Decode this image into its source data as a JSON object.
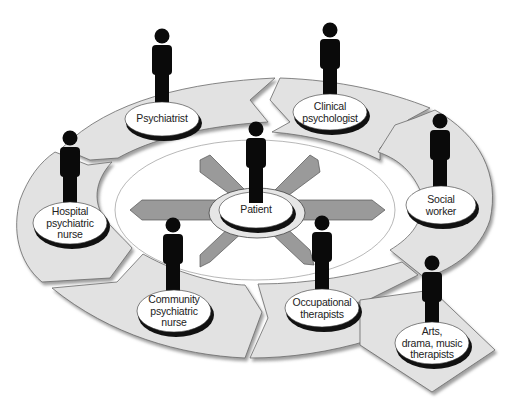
{
  "diagram": {
    "center": {
      "label": "Patient"
    },
    "roles": [
      {
        "id": "psychiatrist",
        "lines": [
          "Psychiatrist"
        ]
      },
      {
        "id": "clinical-psychologist",
        "lines": [
          "Clinical",
          "psychologist"
        ]
      },
      {
        "id": "social-worker",
        "lines": [
          "Social",
          "worker"
        ]
      },
      {
        "id": "hospital-psychiatric-nurse",
        "lines": [
          "Hospital",
          "psychiatric",
          "nurse"
        ]
      },
      {
        "id": "community-psychiatric-nurse",
        "lines": [
          "Community",
          "psychiatric",
          "nurse"
        ]
      },
      {
        "id": "occupational-therapists",
        "lines": [
          "Occupational",
          "therapists"
        ]
      },
      {
        "id": "arts-drama-music-therapists",
        "lines": [
          "Arts,",
          "drama, music",
          "therapists"
        ]
      }
    ],
    "colors": {
      "ring_fill": "#e2e2e2",
      "ring_stroke": "#6a6a6a",
      "arrow_fill": "#9a9a9a",
      "figure": "#0a0a0a",
      "platform_fill": "#ffffff",
      "platform_shadow": "#111111",
      "center_ring": "#e6e6e6"
    }
  }
}
